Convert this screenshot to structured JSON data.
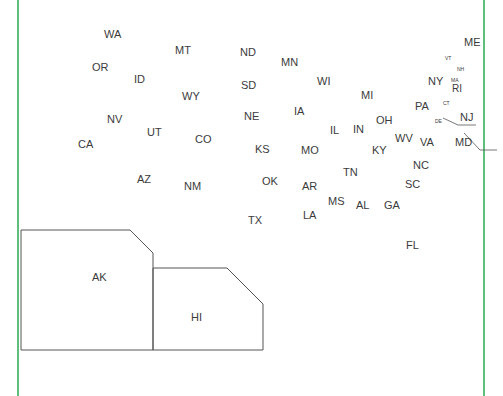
{
  "map": {
    "title": "United States outline map with state abbreviations",
    "frame_color": "#5fbf7a",
    "states": [
      {
        "abbr": "WA",
        "x": 104,
        "y": 29
      },
      {
        "abbr": "MT",
        "x": 175,
        "y": 45
      },
      {
        "abbr": "ND",
        "x": 240,
        "y": 47
      },
      {
        "abbr": "MN",
        "x": 281,
        "y": 57
      },
      {
        "abbr": "OR",
        "x": 92,
        "y": 62
      },
      {
        "abbr": "ID",
        "x": 134,
        "y": 74
      },
      {
        "abbr": "SD",
        "x": 241,
        "y": 80
      },
      {
        "abbr": "WI",
        "x": 317,
        "y": 76
      },
      {
        "abbr": "WY",
        "x": 182,
        "y": 91
      },
      {
        "abbr": "MI",
        "x": 361,
        "y": 90
      },
      {
        "abbr": "NE",
        "x": 244,
        "y": 111
      },
      {
        "abbr": "IA",
        "x": 294,
        "y": 106
      },
      {
        "abbr": "NV",
        "x": 107,
        "y": 114
      },
      {
        "abbr": "UT",
        "x": 147,
        "y": 127
      },
      {
        "abbr": "CO",
        "x": 195,
        "y": 134
      },
      {
        "abbr": "CA",
        "x": 78,
        "y": 139
      },
      {
        "abbr": "IL",
        "x": 330,
        "y": 125
      },
      {
        "abbr": "IN",
        "x": 353,
        "y": 124
      },
      {
        "abbr": "OH",
        "x": 376,
        "y": 115
      },
      {
        "abbr": "WV",
        "x": 395,
        "y": 133
      },
      {
        "abbr": "KY",
        "x": 372,
        "y": 145
      },
      {
        "abbr": "KS",
        "x": 255,
        "y": 144
      },
      {
        "abbr": "MO",
        "x": 301,
        "y": 145
      },
      {
        "abbr": "AZ",
        "x": 137,
        "y": 174
      },
      {
        "abbr": "NM",
        "x": 184,
        "y": 181
      },
      {
        "abbr": "OK",
        "x": 262,
        "y": 176
      },
      {
        "abbr": "AR",
        "x": 302,
        "y": 181
      },
      {
        "abbr": "TN",
        "x": 343,
        "y": 167
      },
      {
        "abbr": "NC",
        "x": 413,
        "y": 160
      },
      {
        "abbr": "SC",
        "x": 405,
        "y": 179
      },
      {
        "abbr": "MS",
        "x": 328,
        "y": 196
      },
      {
        "abbr": "AL",
        "x": 356,
        "y": 200
      },
      {
        "abbr": "GA",
        "x": 384,
        "y": 200
      },
      {
        "abbr": "LA",
        "x": 303,
        "y": 210
      },
      {
        "abbr": "TX",
        "x": 248,
        "y": 215
      },
      {
        "abbr": "FL",
        "x": 406,
        "y": 240
      },
      {
        "abbr": "PA",
        "x": 415,
        "y": 101
      },
      {
        "abbr": "VA",
        "x": 420,
        "y": 137
      },
      {
        "abbr": "NY",
        "x": 428,
        "y": 76
      },
      {
        "abbr": "ME",
        "x": 464,
        "y": 37
      }
    ],
    "small_states": [
      {
        "abbr": "VT",
        "x": 445,
        "y": 56
      },
      {
        "abbr": "NH",
        "x": 457,
        "y": 67
      },
      {
        "abbr": "MA",
        "x": 451,
        "y": 78
      },
      {
        "abbr": "CT",
        "x": 443,
        "y": 101
      },
      {
        "abbr": "DE",
        "x": 435,
        "y": 119
      }
    ],
    "mid_states": [
      {
        "abbr": "RI",
        "x": 452,
        "y": 84
      }
    ],
    "leader_states": [
      {
        "abbr": "NJ",
        "x": 460,
        "y": 112
      },
      {
        "abbr": "MD",
        "x": 455,
        "y": 137
      }
    ],
    "insets": [
      {
        "abbr": "AK",
        "label_x": 92,
        "label_y": 272
      },
      {
        "abbr": "HI",
        "label_x": 191,
        "label_y": 312
      }
    ]
  }
}
